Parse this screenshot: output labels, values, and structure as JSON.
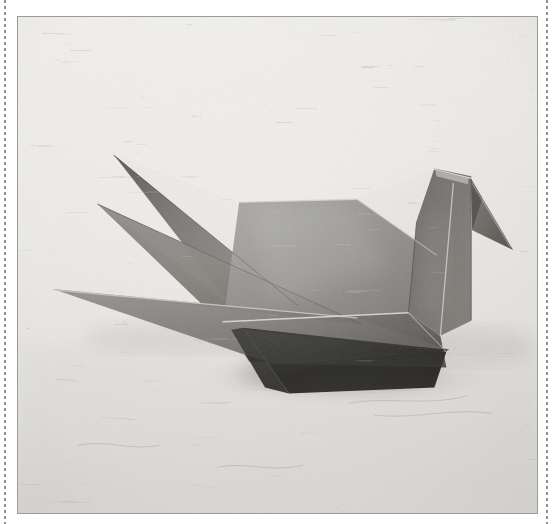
{
  "page": {
    "width": 553,
    "height": 524,
    "background_color": "#ffffff",
    "caption": "Black and white photograph of a folded paper origami crane resting on a textured paper surface"
  },
  "decorations": {
    "left_rule_name": "dashed-rule-left",
    "right_rule_name": "dashed-rule-right",
    "rule_color": "#8f8f8f"
  },
  "photo": {
    "frame": {
      "x": 17,
      "y": 16,
      "width": 521,
      "height": 498,
      "border_color": "#9a9a9a",
      "border_width": 1
    },
    "subject": "origami crane",
    "medium": "folded paper",
    "treatment": "black and white",
    "background_surface": "speckled handmade paper",
    "background_color": "#e9e7e4",
    "surface_shadow_color": "#b9b7b4",
    "palette": {
      "paper_light": "#edebe8",
      "paper_mid": "#d9d7d4",
      "crane_light": "#8e8c89",
      "crane_mid": "#6e6c69",
      "crane_dark": "#55534f",
      "crane_darker": "#403e3b",
      "crane_shadow": "#1c1b19",
      "fold_highlight": "#c9c7c4",
      "fold_line": "#2e2d2b"
    }
  },
  "chart_data": {
    "type": "scatter",
    "xlabel": "x (px, photo-local)",
    "ylabel": "y (px, photo-local)",
    "xlim": [
      0,
      521
    ],
    "ylim": [
      0,
      498
    ],
    "grid": false,
    "legend_position": "none",
    "annotations": [
      "upper wing tip",
      "lower wing tip",
      "tail point",
      "head apex",
      "beak tip",
      "body keel"
    ],
    "series": [
      {
        "name": "upper-wing",
        "fill": "#5e5c58",
        "values": [
          [
            83,
            141
          ],
          [
            215,
            290
          ],
          [
            275,
            290
          ],
          [
            160,
            170
          ],
          [
            96,
            138
          ]
        ]
      },
      {
        "name": "mid-wing",
        "fill": "#74726e",
        "values": [
          [
            79,
            187
          ],
          [
            333,
            305
          ],
          [
            206,
            305
          ],
          [
            82,
            190
          ]
        ]
      },
      {
        "name": "body-upper",
        "fill": "#7d7b77",
        "values": [
          [
            222,
            186
          ],
          [
            340,
            184
          ],
          [
            420,
            235
          ],
          [
            340,
            300
          ],
          [
            200,
            300
          ]
        ]
      },
      {
        "name": "body-lower",
        "fill": "#5a5854",
        "values": [
          [
            206,
            305
          ],
          [
            418,
            300
          ],
          [
            430,
            345
          ],
          [
            230,
            350
          ]
        ]
      },
      {
        "name": "tail-blade",
        "fill": "#6b6965",
        "values": [
          [
            35,
            273
          ],
          [
            335,
            300
          ],
          [
            420,
            330
          ],
          [
            250,
            345
          ]
        ]
      },
      {
        "name": "keel-shadow",
        "fill": "#15140f",
        "values": [
          [
            225,
            312
          ],
          [
            420,
            330
          ],
          [
            400,
            375
          ],
          [
            258,
            368
          ]
        ]
      },
      {
        "name": "neck",
        "fill": "#514f4c",
        "values": [
          [
            420,
            155
          ],
          [
            455,
            162
          ],
          [
            455,
            300
          ],
          [
            392,
            290
          ]
        ]
      },
      {
        "name": "beak",
        "fill": "#5d5b57",
        "values": [
          [
            452,
            168
          ],
          [
            495,
            232
          ],
          [
            452,
            215
          ]
        ]
      }
    ]
  }
}
